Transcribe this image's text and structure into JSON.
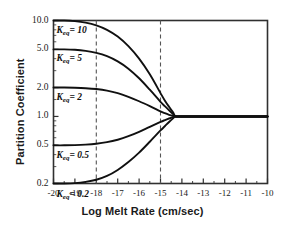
{
  "chart_data": {
    "type": "line",
    "title": "",
    "xlabel": "Log Melt Rate (cm/sec)",
    "ylabel": "Partition Coefficient",
    "xlim": [
      -20,
      -10
    ],
    "ylim": [
      0.2,
      10
    ],
    "yscale": "log",
    "xscale": "linear",
    "grid": false,
    "legend": "inline-curve-labels",
    "xticks": [
      -20,
      -19,
      -18,
      -17,
      -16,
      -15,
      -14,
      -13,
      -12,
      -11,
      -10
    ],
    "xticklabels": [
      "-20",
      "-19",
      "-18",
      "-17",
      "-16",
      "-15",
      "-14",
      "-13",
      "-12",
      "-11",
      "-10"
    ],
    "yticks": [
      10.0,
      5.0,
      2.0,
      1.0,
      0.5,
      0.2
    ],
    "yticklabels": [
      "10.0",
      "5.0",
      "2.0",
      "1.0",
      "0.5",
      "0.2"
    ],
    "annotations": [
      {
        "name": "dashed-line-left",
        "type": "vline",
        "x": -18,
        "style": "dashed"
      },
      {
        "name": "dashed-line-right",
        "type": "vline",
        "x": -15,
        "style": "dashed"
      }
    ],
    "series": [
      {
        "name": "Keq = 10",
        "label_prefix": "K",
        "label_sub": "eq",
        "label_value": "= 10",
        "plateau": 10.0,
        "converged_value": 1.0,
        "x": [
          -20.0,
          -19.5,
          -19.0,
          -18.5,
          -18.0,
          -17.5,
          -17.0,
          -16.5,
          -16.0,
          -15.5,
          -15.0,
          -14.8,
          -14.6,
          -14.4,
          -14.3,
          -14.0,
          -13.0,
          -12.0,
          -11.0,
          -10.0
        ],
        "y": [
          10.0,
          10.0,
          9.85,
          9.5,
          8.9,
          8.0,
          6.8,
          5.4,
          4.0,
          2.75,
          1.75,
          1.47,
          1.26,
          1.09,
          1.0,
          1.0,
          1.0,
          1.0,
          1.0,
          1.0
        ]
      },
      {
        "name": "Keq = 5",
        "label_prefix": "K",
        "label_sub": "eq",
        "label_value": "= 5",
        "plateau": 5.0,
        "converged_value": 1.0,
        "x": [
          -20.0,
          -19.5,
          -19.0,
          -18.5,
          -18.0,
          -17.5,
          -17.0,
          -16.5,
          -16.0,
          -15.5,
          -15.0,
          -14.8,
          -14.6,
          -14.4,
          -14.3,
          -14.0,
          -13.0,
          -12.0,
          -11.0,
          -10.0
        ],
        "y": [
          5.0,
          5.0,
          4.95,
          4.82,
          4.6,
          4.25,
          3.75,
          3.15,
          2.5,
          1.9,
          1.42,
          1.28,
          1.16,
          1.05,
          1.0,
          1.0,
          1.0,
          1.0,
          1.0,
          1.0
        ]
      },
      {
        "name": "Keq = 2",
        "label_prefix": "K",
        "label_sub": "eq",
        "label_value": "= 2",
        "plateau": 2.0,
        "converged_value": 1.0,
        "x": [
          -20.0,
          -19.5,
          -19.0,
          -18.5,
          -18.0,
          -17.5,
          -17.0,
          -16.5,
          -16.0,
          -15.5,
          -15.0,
          -14.8,
          -14.6,
          -14.4,
          -14.3,
          -14.0,
          -13.0,
          -12.0,
          -11.0,
          -10.0
        ],
        "y": [
          2.0,
          2.0,
          1.99,
          1.97,
          1.93,
          1.86,
          1.75,
          1.6,
          1.44,
          1.28,
          1.13,
          1.08,
          1.04,
          1.01,
          1.0,
          1.0,
          1.0,
          1.0,
          1.0,
          1.0
        ]
      },
      {
        "name": "Keq = 0.5",
        "label_prefix": "K",
        "label_sub": "eq",
        "label_value": "= 0.5",
        "plateau": 0.5,
        "converged_value": 1.0,
        "x": [
          -20.0,
          -19.5,
          -19.0,
          -18.5,
          -18.0,
          -17.5,
          -17.0,
          -16.5,
          -16.0,
          -15.5,
          -15.0,
          -14.8,
          -14.6,
          -14.4,
          -14.3,
          -14.0,
          -13.0,
          -12.0,
          -11.0,
          -10.0
        ],
        "y": [
          0.5,
          0.5,
          0.502,
          0.508,
          0.519,
          0.539,
          0.572,
          0.622,
          0.69,
          0.78,
          0.877,
          0.915,
          0.952,
          0.985,
          1.0,
          1.0,
          1.0,
          1.0,
          1.0,
          1.0
        ]
      },
      {
        "name": "Keq = 0.2",
        "label_prefix": "K",
        "label_sub": "eq",
        "label_value": "= 0.2",
        "plateau": 0.2,
        "converged_value": 1.0,
        "x": [
          -20.0,
          -19.5,
          -19.0,
          -18.5,
          -18.0,
          -17.5,
          -17.0,
          -16.5,
          -16.0,
          -15.5,
          -15.0,
          -14.8,
          -14.6,
          -14.4,
          -14.3,
          -14.0,
          -13.0,
          -12.0,
          -11.0,
          -10.0
        ],
        "y": [
          0.2,
          0.2,
          0.202,
          0.208,
          0.219,
          0.24,
          0.277,
          0.335,
          0.42,
          0.545,
          0.715,
          0.79,
          0.875,
          0.96,
          1.0,
          1.0,
          1.0,
          1.0,
          1.0,
          1.0
        ]
      }
    ]
  },
  "axis": {
    "x_title": "Log Melt Rate (cm/sec)",
    "y_title": "Partition Coefficient"
  },
  "colors": {
    "curve": "#101010",
    "frame": "#303030",
    "dashed": "#555555",
    "text": "#1a1a1a"
  }
}
